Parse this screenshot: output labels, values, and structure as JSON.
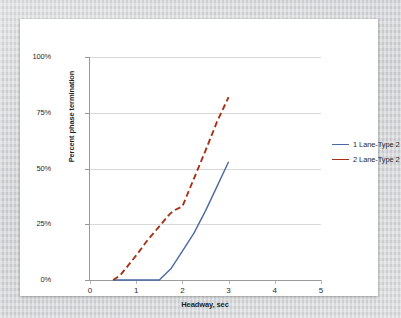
{
  "chart_data": {
    "type": "line",
    "title": "",
    "xlabel": "Headway, sec",
    "ylabel": "Percent phase termination",
    "xlim": [
      0,
      5
    ],
    "ylim": [
      0,
      100
    ],
    "xticks": [
      0,
      1,
      2,
      3,
      4,
      5
    ],
    "xtick_labels": [
      "0",
      "1",
      "2",
      "3",
      "4",
      "5"
    ],
    "yticks": [
      0,
      25,
      50,
      75,
      100
    ],
    "ytick_labels": [
      "0%",
      "25%",
      "50%",
      "75%",
      "100%"
    ],
    "grid": "horizontal",
    "legend_position": "right",
    "series": [
      {
        "name": "1 Lane-Type 2",
        "color": "#4a69a5",
        "style": "solid",
        "points": [
          {
            "x": 0.5,
            "y": 0
          },
          {
            "x": 1.5,
            "y": 0
          },
          {
            "x": 1.75,
            "y": 5
          },
          {
            "x": 2.0,
            "y": 13
          },
          {
            "x": 2.25,
            "y": 21
          },
          {
            "x": 2.5,
            "y": 31
          },
          {
            "x": 2.75,
            "y": 42
          },
          {
            "x": 3.0,
            "y": 53
          }
        ]
      },
      {
        "name": "2 Lane-Type 2",
        "color": "#a63218",
        "style": "dashed",
        "points": [
          {
            "x": 0.5,
            "y": 0
          },
          {
            "x": 0.65,
            "y": 2
          },
          {
            "x": 1.0,
            "y": 11
          },
          {
            "x": 1.25,
            "y": 18
          },
          {
            "x": 1.5,
            "y": 24
          },
          {
            "x": 1.7,
            "y": 29
          },
          {
            "x": 1.8,
            "y": 31
          },
          {
            "x": 2.0,
            "y": 33
          },
          {
            "x": 2.1,
            "y": 38
          },
          {
            "x": 2.3,
            "y": 48
          },
          {
            "x": 2.5,
            "y": 58
          },
          {
            "x": 2.75,
            "y": 71
          },
          {
            "x": 3.0,
            "y": 82
          }
        ]
      }
    ]
  },
  "legend": {
    "items": [
      {
        "label": "1 Lane-Type 2"
      },
      {
        "label": "2 Lane-Type 2"
      }
    ]
  },
  "colors": {
    "series_1": "#4a69a5",
    "series_2": "#a63218",
    "grid": "#d9d9d9",
    "axis": "#9a9a9a",
    "card": "#ffffff",
    "backdrop": "#d4d6d8"
  }
}
